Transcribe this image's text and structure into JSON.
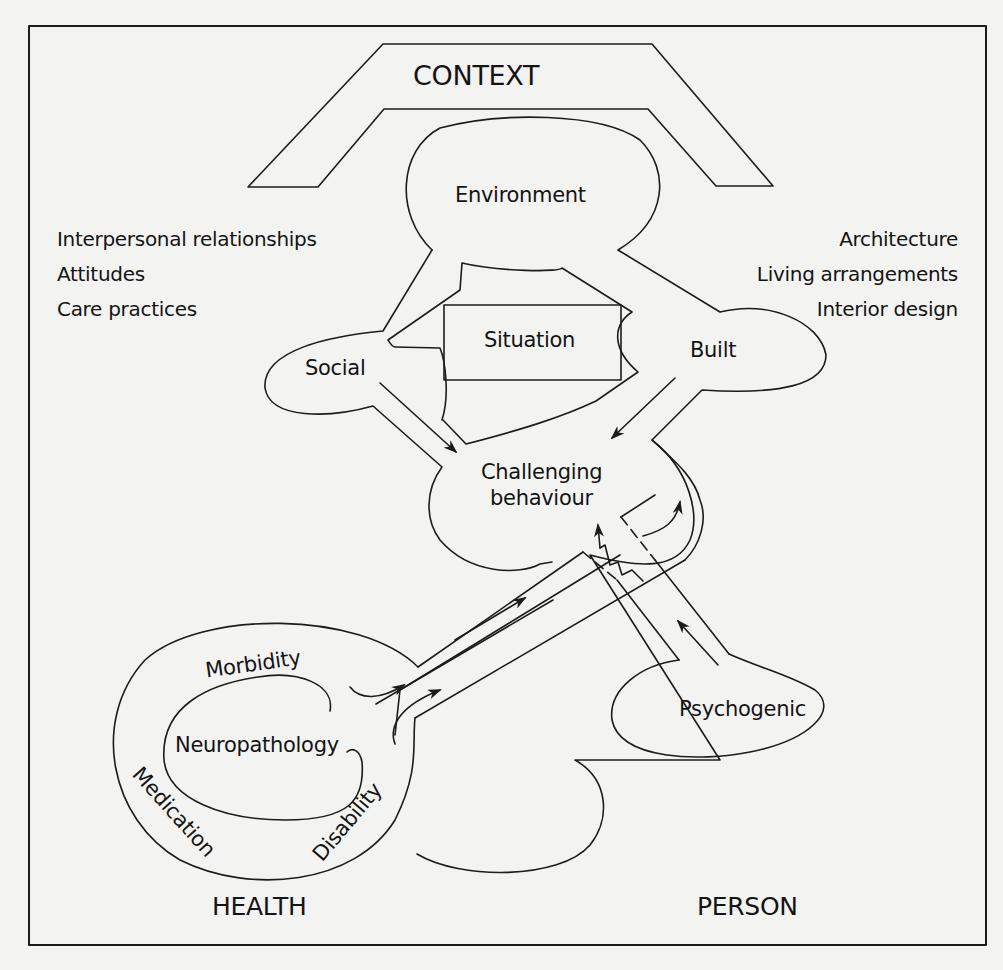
{
  "diagram": {
    "title_top": "CONTEXT",
    "bottom_left_title": "HEALTH",
    "bottom_right_title": "PERSON",
    "environment": {
      "label": "Environment",
      "social": "Social",
      "situation": "Situation",
      "built": "Built"
    },
    "center": {
      "line1": "Challenging",
      "line2": "behaviour"
    },
    "left_context_items": [
      "Interpersonal relationships",
      "Attitudes",
      "Care practices"
    ],
    "right_context_items": [
      "Architecture",
      "Living arrangements",
      "Interior design"
    ],
    "health": {
      "inner": "Neuropathology",
      "ring": [
        "Morbidity",
        "Medication",
        "Disability"
      ]
    },
    "person": {
      "label": "Psychogenic"
    },
    "colors": {
      "background": "#f3f3f1",
      "stroke": "#1c1c1c"
    }
  }
}
